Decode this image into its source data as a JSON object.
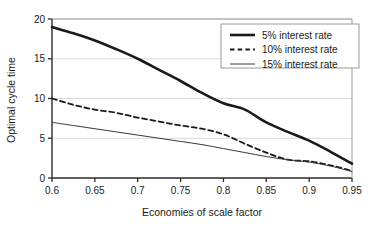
{
  "chart_data": {
    "type": "line",
    "title": "",
    "xlabel": "Economies of scale factor",
    "ylabel": "Optimal cycle time",
    "xlim": [
      0.6,
      0.95
    ],
    "ylim": [
      0,
      20
    ],
    "xticks": [
      "0.6",
      "0.65",
      "0.7",
      "0.75",
      "0.8",
      "0.85",
      "0.9",
      "0.95"
    ],
    "xtick_values": [
      0.6,
      0.65,
      0.7,
      0.75,
      0.8,
      0.85,
      0.9,
      0.95
    ],
    "yticks": [
      "0",
      "5",
      "10",
      "15",
      "20"
    ],
    "ytick_values": [
      0,
      5,
      10,
      15,
      20
    ],
    "grid": "horizontal",
    "grid_color": "#d9d9d9",
    "axis_color": "#2b2b2b",
    "legend_position": "top-right",
    "x": [
      0.6,
      0.625,
      0.65,
      0.675,
      0.7,
      0.725,
      0.75,
      0.775,
      0.8,
      0.825,
      0.85,
      0.875,
      0.9,
      0.925,
      0.95
    ],
    "series": [
      {
        "name": "5% interest rate",
        "style": "solid-thick",
        "color": "#1a1a1a",
        "width": 2.6,
        "values": [
          19.0,
          18.2,
          17.3,
          16.2,
          15.0,
          13.6,
          12.2,
          10.7,
          9.4,
          8.6,
          7.0,
          5.8,
          4.7,
          3.3,
          1.8
        ]
      },
      {
        "name": "10% interest rate",
        "style": "dashed",
        "color": "#1a1a1a",
        "width": 1.8,
        "values": [
          10.0,
          9.2,
          8.6,
          8.2,
          7.6,
          7.1,
          6.6,
          6.2,
          5.5,
          4.3,
          3.2,
          2.3,
          2.1,
          1.6,
          0.9
        ]
      },
      {
        "name": "15% interest rate",
        "style": "solid-thin",
        "color": "#3a3a3a",
        "width": 1.0,
        "values": [
          7.0,
          6.6,
          6.2,
          5.8,
          5.4,
          5.0,
          4.6,
          4.2,
          3.7,
          3.2,
          2.7,
          2.3,
          2.0,
          1.5,
          0.8
        ]
      }
    ],
    "legend": [
      {
        "label": "5% interest rate",
        "style": "solid-thick"
      },
      {
        "label": "10% interest rate",
        "style": "dashed"
      },
      {
        "label": "15% interest rate",
        "style": "solid-thin"
      }
    ]
  }
}
